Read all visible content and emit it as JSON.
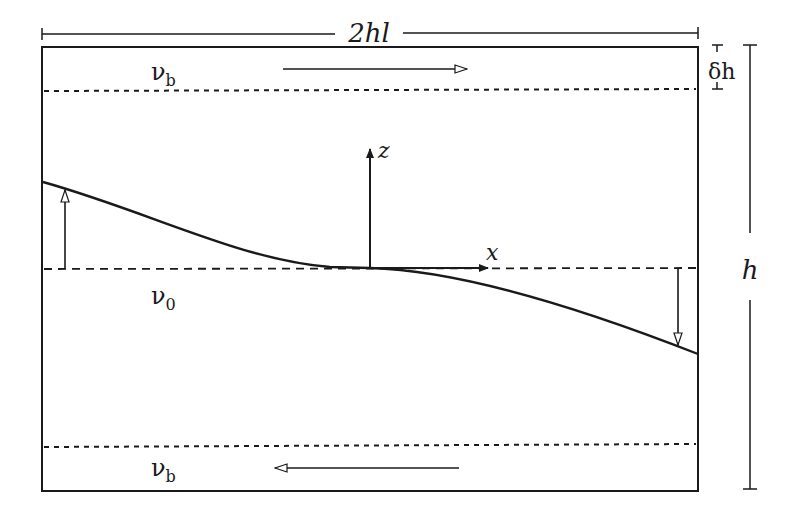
{
  "diagram": {
    "width_label": "2hl",
    "height_label": "h",
    "boundary_thickness_label": "δh",
    "top_layer_label": {
      "main": "ν",
      "sub": "b"
    },
    "middle_layer_label": {
      "main": "ν",
      "sub": "0"
    },
    "bottom_layer_label": {
      "main": "ν",
      "sub": "b"
    },
    "axis_x_label": "x",
    "axis_z_label": "z",
    "top_flow_direction": "right",
    "bottom_flow_direction": "left",
    "colors": {
      "ink": "#1a1a1a",
      "background": "#ffffff"
    }
  }
}
